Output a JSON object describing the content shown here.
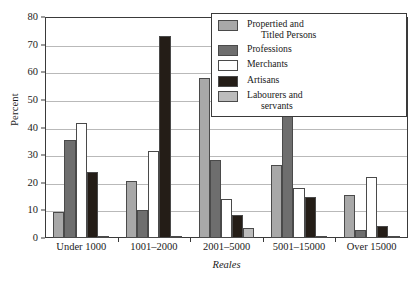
{
  "chart_data": {
    "type": "bar",
    "title": "",
    "xlabel": "Reales",
    "ylabel": "Percent",
    "ylim": [
      0,
      80
    ],
    "ytick_values": [
      0,
      10,
      20,
      30,
      40,
      50,
      60,
      70,
      80
    ],
    "ytick_labels": [
      "0",
      "10",
      "20",
      "30",
      "40",
      "50",
      "60",
      "70",
      "80"
    ],
    "grid": true,
    "legend_position": "top-right",
    "categories": [
      "Under 1000",
      "1001–2000",
      "2001–5000",
      "5001–15000",
      "Over 15000"
    ],
    "series": [
      {
        "name": "Propertied and Titled Persons",
        "name_line1": "Propertied and",
        "name_line2": "Titled Persons",
        "color": "#a8a8a8",
        "values": [
          9.3,
          20.8,
          58.0,
          26.5,
          15.6
        ]
      },
      {
        "name": "Professions",
        "name_line1": "Professions",
        "name_line2": "",
        "color": "#6e6e6e",
        "values": [
          35.5,
          10.1,
          28.3,
          57.0,
          3.0
        ]
      },
      {
        "name": "Merchants",
        "name_line1": "Merchants",
        "name_line2": "",
        "color": "#ffffff",
        "values": [
          41.7,
          31.5,
          14.1,
          18.0,
          22.2
        ]
      },
      {
        "name": "Artisans",
        "name_line1": "Artisans",
        "name_line2": "",
        "color": "#241d17",
        "values": [
          23.8,
          73.0,
          8.5,
          15.0,
          4.5
        ]
      },
      {
        "name": "Labourers and servants",
        "name_line1": "Labourers and",
        "name_line2": "servants",
        "color": "#bcbcbc",
        "values": [
          0.5,
          0.6,
          3.5,
          0.4,
          0.4
        ]
      }
    ]
  }
}
